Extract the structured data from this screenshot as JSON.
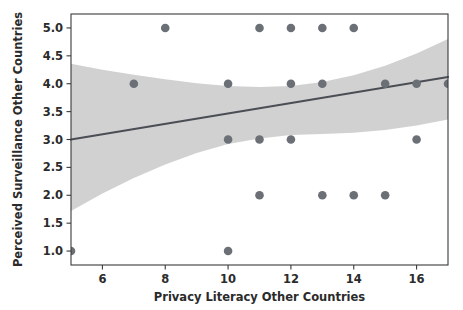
{
  "chart_data": {
    "type": "scatter",
    "title": "",
    "xlabel": "Privacy Literacy Other Countries",
    "ylabel": "Perceived Surveillance Other Countries",
    "xlim": [
      5,
      17
    ],
    "ylim": [
      0.75,
      5.25
    ],
    "grid": false,
    "legend": null,
    "xticks": [
      6,
      8,
      10,
      12,
      14,
      16
    ],
    "xtick_labels": [
      "6",
      "8",
      "10",
      "12",
      "14",
      "16"
    ],
    "yticks": [
      1.0,
      1.5,
      2.0,
      2.5,
      3.0,
      3.5,
      4.0,
      4.5,
      5.0
    ],
    "ytick_labels": [
      "1.0",
      "1.5",
      "2.0",
      "2.5",
      "3.0",
      "3.5",
      "4.0",
      "4.5",
      "5.0"
    ],
    "points": [
      {
        "x": 5,
        "y": 1.0
      },
      {
        "x": 10,
        "y": 1.0
      },
      {
        "x": 11,
        "y": 2.0
      },
      {
        "x": 13,
        "y": 2.0
      },
      {
        "x": 14,
        "y": 2.0
      },
      {
        "x": 15,
        "y": 2.0
      },
      {
        "x": 10,
        "y": 3.0
      },
      {
        "x": 11,
        "y": 3.0
      },
      {
        "x": 12,
        "y": 3.0
      },
      {
        "x": 16,
        "y": 3.0
      },
      {
        "x": 7,
        "y": 4.0
      },
      {
        "x": 10,
        "y": 4.0
      },
      {
        "x": 12,
        "y": 4.0
      },
      {
        "x": 13,
        "y": 4.0
      },
      {
        "x": 15,
        "y": 4.0
      },
      {
        "x": 16,
        "y": 4.0
      },
      {
        "x": 17,
        "y": 4.0
      },
      {
        "x": 8,
        "y": 5.0
      },
      {
        "x": 11,
        "y": 5.0
      },
      {
        "x": 12,
        "y": 5.0
      },
      {
        "x": 13,
        "y": 5.0
      },
      {
        "x": 14,
        "y": 5.0
      }
    ],
    "regression_line": {
      "x": [
        5,
        17
      ],
      "y": [
        3.0,
        4.12
      ]
    },
    "confidence_band": {
      "x": [
        5,
        6,
        7,
        8,
        9,
        10,
        11,
        12,
        13,
        14,
        15,
        16,
        17
      ],
      "upper": [
        4.36,
        4.25,
        4.16,
        4.08,
        4.01,
        3.96,
        3.94,
        3.96,
        4.03,
        4.15,
        4.32,
        4.54,
        4.8
      ],
      "lower": [
        1.72,
        2.03,
        2.31,
        2.55,
        2.76,
        2.92,
        3.02,
        3.08,
        3.1,
        3.12,
        3.17,
        3.25,
        3.36
      ]
    },
    "colors": {
      "point": "#6b6f76",
      "line": "#4a4e55",
      "band": "#cfcfcf",
      "axis": "#3a3a3a",
      "text": "#2b2b2b",
      "background": "#ffffff"
    }
  }
}
